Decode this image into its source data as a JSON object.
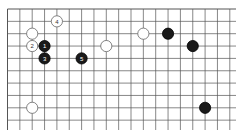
{
  "diagram": {
    "type": "go-board-fragment",
    "grid": {
      "columns": 19,
      "rows": 10,
      "origin_x": 7.5,
      "origin_y": 9,
      "spacing": 12.35,
      "line_color": "#555555",
      "board_color": "#ffffff"
    },
    "stones": [
      {
        "color": "white",
        "col": 4,
        "row": 1,
        "label": "4"
      },
      {
        "color": "white",
        "col": 2,
        "row": 2,
        "label": ""
      },
      {
        "color": "white",
        "col": 2,
        "row": 3,
        "label": "2"
      },
      {
        "color": "black",
        "col": 3,
        "row": 3,
        "label": "1"
      },
      {
        "color": "black",
        "col": 3,
        "row": 4,
        "label": "3"
      },
      {
        "color": "black",
        "col": 6,
        "row": 4,
        "label": "5"
      },
      {
        "color": "white",
        "col": 8,
        "row": 3,
        "label": ""
      },
      {
        "color": "white",
        "col": 11,
        "row": 2,
        "label": ""
      },
      {
        "color": "black",
        "col": 13,
        "row": 2,
        "label": ""
      },
      {
        "color": "black",
        "col": 15,
        "row": 3,
        "label": ""
      },
      {
        "color": "white",
        "col": 2,
        "row": 8,
        "label": ""
      },
      {
        "color": "black",
        "col": 16,
        "row": 8,
        "label": ""
      }
    ]
  }
}
